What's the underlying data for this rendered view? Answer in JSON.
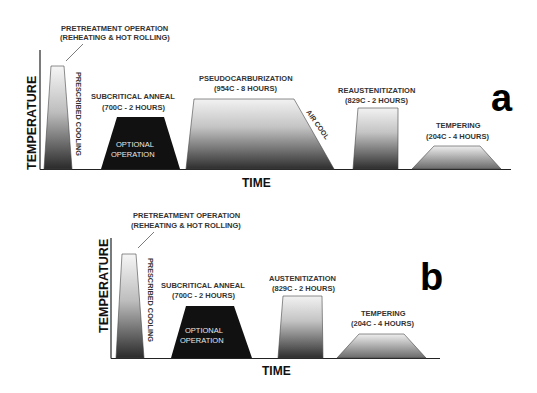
{
  "figure": {
    "x_axis_label": "TIME",
    "y_axis_label": "TEMPERATURE"
  },
  "panel_a": {
    "letter": "a",
    "pretreatment": {
      "line1": "PRETREATMENT OPERATION",
      "line2": "(REHEATING & HOT ROLLING)",
      "cooling_label": "PRESCRIBED COOLING"
    },
    "subcritical": {
      "line1": "SUBCRITICAL ANNEAL",
      "line2": "(700C - 2 HOURS)",
      "inner1": "OPTIONAL",
      "inner2": "OPERATION"
    },
    "pseudocarb": {
      "line1": "PSEUDOCARBURIZATION",
      "line2": "(954C - 8 HOURS)",
      "cooling_label": "AIR COOL"
    },
    "reaustenitization": {
      "line1": "REAUSTENITIZATION",
      "line2": "(829C - 2 HOURS)"
    },
    "tempering": {
      "line1": "TEMPERING",
      "line2": "(204C - 4 HOURS)"
    }
  },
  "panel_b": {
    "letter": "b",
    "pretreatment": {
      "line1": "PRETREATMENT OPERATION",
      "line2": "(REHEATING & HOT ROLLING)",
      "cooling_label": "PRESCRIBED COOLING"
    },
    "subcritical": {
      "line1": "SUBCRITICAL ANNEAL",
      "line2": "(700C - 2 HOURS)",
      "inner1": "OPTIONAL",
      "inner2": "OPERATION"
    },
    "austenitization": {
      "line1": "AUSTENITIZATION",
      "line2": "(829C - 2 HOURS)"
    },
    "tempering": {
      "line1": "TEMPERING",
      "line2": "(204C - 4 HOURS)"
    }
  },
  "colors": {
    "gradient_top": "#f4f4f4",
    "gradient_bottom": "#2a2a2a",
    "optional_fill": "#111111",
    "axis": "#222222",
    "text": "#333333"
  }
}
